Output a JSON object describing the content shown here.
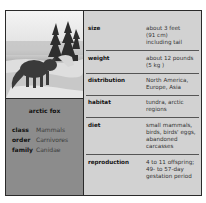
{
  "animal": {
    "name": "arctic fox",
    "photo_icon": "arctic-fox-photo"
  },
  "taxonomy": [
    {
      "key": "class",
      "value": "Mammals"
    },
    {
      "key": "order",
      "value": "Carnivores"
    },
    {
      "key": "family",
      "value": "Canidae"
    }
  ],
  "facts": [
    {
      "label": "size",
      "lines": [
        "about 3 feet",
        "(91 cm)",
        "including tail"
      ]
    },
    {
      "label": "weight",
      "lines": [
        "about 12 pounds",
        "(5 kg )"
      ]
    },
    {
      "label": "distribution",
      "lines": [
        "North America,",
        "Europe, Asia"
      ]
    },
    {
      "label": "habitat",
      "lines": [
        "tundra, arctic",
        "regions"
      ]
    },
    {
      "label": "diet",
      "lines": [
        "small mammals,",
        "birds, birds' eggs,",
        "abandoned",
        "carcasses"
      ]
    },
    {
      "label": "reproduction",
      "lines": [
        "4 to 11 offspring;",
        "49- to 57-day",
        "gestation period"
      ]
    }
  ],
  "colors": {
    "right_panel_bg": "#d2d2d2",
    "left_panel_bg": "#8c8c8c",
    "border": "#2a2a2a"
  }
}
